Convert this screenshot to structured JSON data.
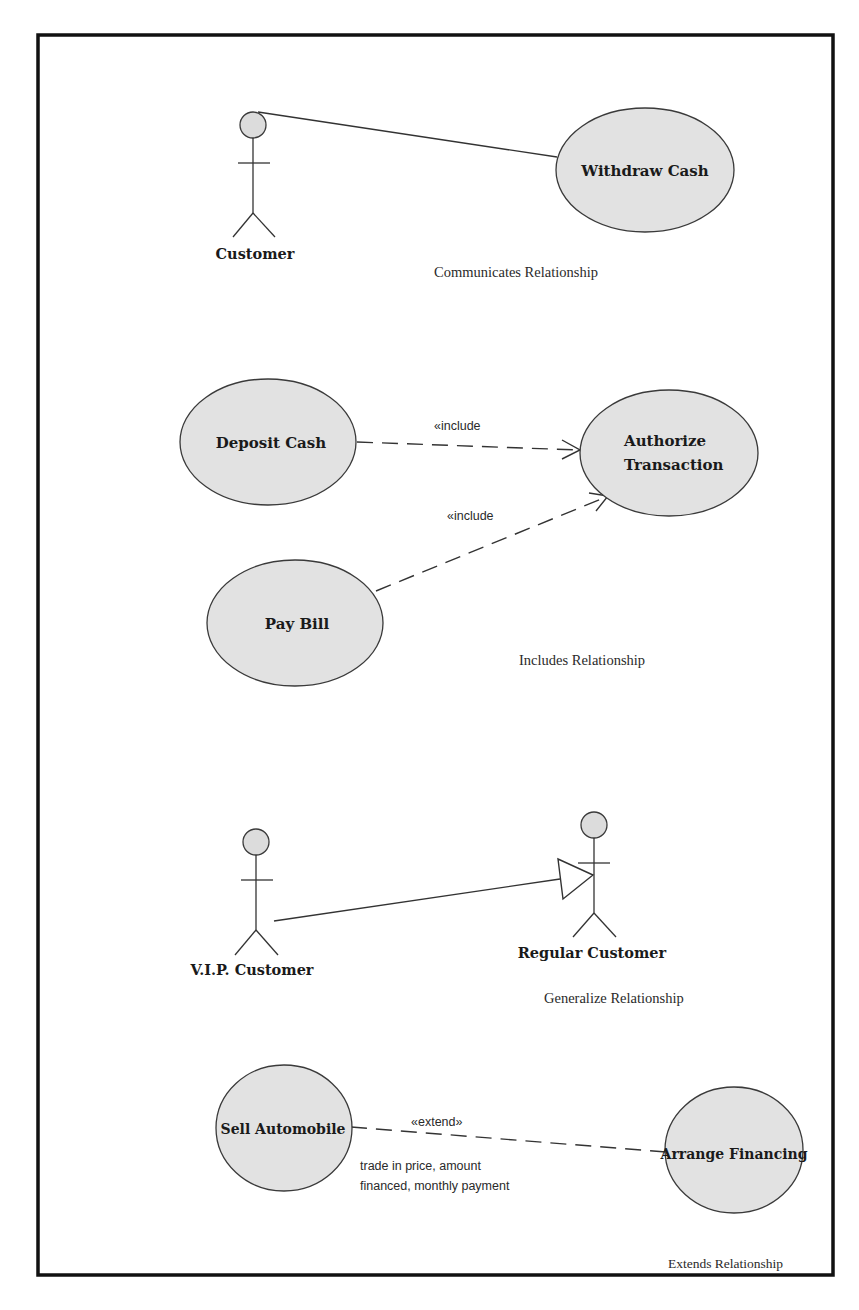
{
  "diagram": {
    "type": "UML use case diagram",
    "sections": {
      "communicates": {
        "actor": "Customer",
        "use_case": "Withdraw Cash",
        "caption": "Communicates Relationship"
      },
      "includes": {
        "use_cases": {
          "deposit": "Deposit Cash",
          "authorize_line1": "Authorize",
          "authorize_line2": "Transaction",
          "pay_bill": "Pay Bill"
        },
        "stereotype_1": "«include",
        "stereotype_2": "«include",
        "caption": "Includes Relationship"
      },
      "generalize": {
        "child_actor": "V.I.P. Customer",
        "parent_actor": "Regular Customer",
        "caption": "Generalize Relationship"
      },
      "extends": {
        "base_use_case": "Sell Automobile",
        "extension_use_case": "Arrange Financing",
        "stereotype": "«extend»",
        "note_line1": "trade in price, amount",
        "note_line2": "financed, monthly payment",
        "caption": "Extends Relationship"
      }
    },
    "colors": {
      "use_case_fill": "#e2e2e2",
      "actor_head_fill": "#dcdcdc",
      "stroke": "#333333",
      "frame": "#111111",
      "background": "#ffffff"
    }
  }
}
